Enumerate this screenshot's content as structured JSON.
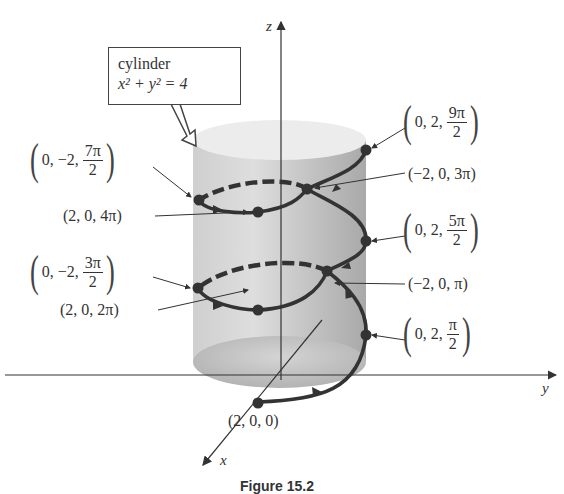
{
  "callout": {
    "title": "cylinder",
    "equation": "x² + y² = 4"
  },
  "axes": {
    "x": "x",
    "y": "y",
    "z": "z"
  },
  "points": [
    {
      "label": "(2, 0, 0)",
      "coords": [
        "2",
        "0",
        "0"
      ]
    },
    {
      "coords": [
        "0",
        "2"
      ],
      "frac_num": "π",
      "frac_den": "2"
    },
    {
      "label": "(−2, 0, π)",
      "coords": [
        "−2",
        "0",
        "π"
      ]
    },
    {
      "label": "(2, 0, 2π)",
      "coords": [
        "2",
        "0",
        "2π"
      ]
    },
    {
      "coords": [
        "0",
        "−2"
      ],
      "frac_num": "3π",
      "frac_den": "2"
    },
    {
      "coords": [
        "0",
        "2"
      ],
      "frac_num": "5π",
      "frac_den": "2"
    },
    {
      "label": "(−2, 0, 3π)",
      "coords": [
        "−2",
        "0",
        "3π"
      ]
    },
    {
      "label": "(2, 0, 4π)",
      "coords": [
        "2",
        "0",
        "4π"
      ]
    },
    {
      "coords": [
        "0",
        "−2"
      ],
      "frac_num": "7π",
      "frac_den": "2"
    },
    {
      "coords": [
        "0",
        "2"
      ],
      "frac_num": "9π",
      "frac_den": "2"
    }
  ],
  "tuple_text": {
    "p1_prefix": "0, 2,",
    "p4_prefix": "0, −2,",
    "p5_prefix": "0, 2,",
    "p8_prefix": "0, −2,",
    "p9_prefix": "0, 2,"
  },
  "caption": "Figure 15.2",
  "colors": {
    "curve": "#333333",
    "cylinder_body": "#c8c8c8",
    "cylinder_top": "#ececec",
    "axis": "#333333"
  }
}
